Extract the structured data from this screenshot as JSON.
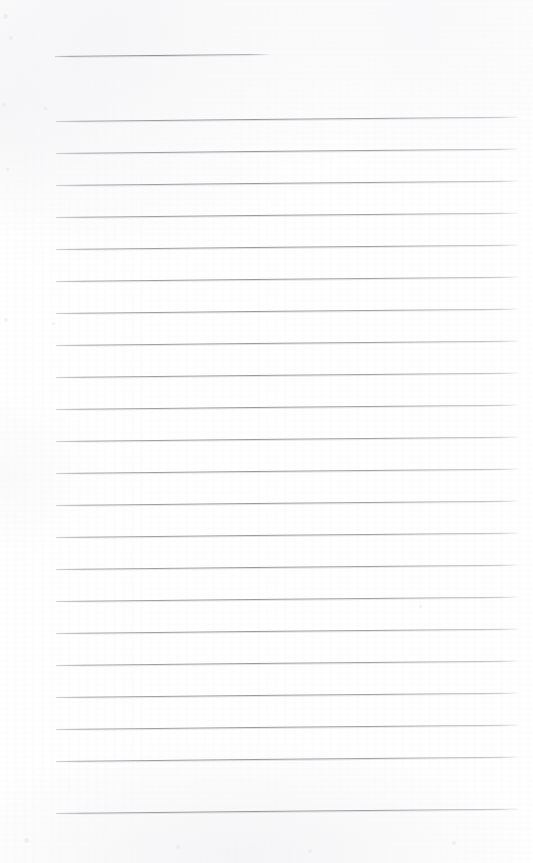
{
  "document": {
    "kind": "scanned-blank-ruled-notepad-page",
    "page_width": 533,
    "page_height": 863,
    "background_color": "#ffffff",
    "paper_tone_color": "#fdfdfe",
    "rule_color": "#96969d",
    "rule_thickness_px": 1,
    "rule_tilt_degrees": -0.55,
    "written_text": "",
    "page_number_text": "",
    "header_text": "",
    "footer_text": ""
  },
  "ruling": {
    "line_spacing_px": 32,
    "left_margin_px": 56,
    "right_margin_px": 518,
    "body_line_count": 22,
    "header_rule": {
      "label": "header-rule",
      "x": 55,
      "y": 56,
      "width": 215
    },
    "lines": [
      {
        "index": 1,
        "y": 121,
        "x": 56,
        "width": 462
      },
      {
        "index": 2,
        "y": 153,
        "x": 56,
        "width": 462
      },
      {
        "index": 3,
        "y": 185,
        "x": 56,
        "width": 462
      },
      {
        "index": 4,
        "y": 217,
        "x": 56,
        "width": 462
      },
      {
        "index": 5,
        "y": 249,
        "x": 56,
        "width": 462
      },
      {
        "index": 6,
        "y": 281,
        "x": 56,
        "width": 462
      },
      {
        "index": 7,
        "y": 313,
        "x": 56,
        "width": 462
      },
      {
        "index": 8,
        "y": 345,
        "x": 56,
        "width": 462
      },
      {
        "index": 9,
        "y": 377,
        "x": 56,
        "width": 462
      },
      {
        "index": 10,
        "y": 409,
        "x": 56,
        "width": 462
      },
      {
        "index": 11,
        "y": 441,
        "x": 56,
        "width": 462
      },
      {
        "index": 12,
        "y": 473,
        "x": 56,
        "width": 462
      },
      {
        "index": 13,
        "y": 505,
        "x": 56,
        "width": 462
      },
      {
        "index": 14,
        "y": 537,
        "x": 56,
        "width": 462
      },
      {
        "index": 15,
        "y": 569,
        "x": 56,
        "width": 462
      },
      {
        "index": 16,
        "y": 601,
        "x": 56,
        "width": 462
      },
      {
        "index": 17,
        "y": 633,
        "x": 56,
        "width": 462
      },
      {
        "index": 18,
        "y": 665,
        "x": 56,
        "width": 462
      },
      {
        "index": 19,
        "y": 697,
        "x": 56,
        "width": 462
      },
      {
        "index": 20,
        "y": 729,
        "x": 56,
        "width": 462
      },
      {
        "index": 21,
        "y": 761,
        "x": 56,
        "width": 462
      },
      {
        "index": 22,
        "y": 813,
        "x": 56,
        "width": 462
      }
    ]
  },
  "specks": [
    {
      "x": 3,
      "y": 14,
      "size": 5
    },
    {
      "x": 9,
      "y": 36,
      "size": 4
    },
    {
      "x": 2,
      "y": 103,
      "size": 4
    },
    {
      "x": 44,
      "y": 107,
      "size": 3
    },
    {
      "x": 6,
      "y": 168,
      "size": 3
    },
    {
      "x": 4,
      "y": 318,
      "size": 4
    },
    {
      "x": 52,
      "y": 322,
      "size": 3
    },
    {
      "x": 419,
      "y": 605,
      "size": 3
    },
    {
      "x": 24,
      "y": 838,
      "size": 5
    },
    {
      "x": 176,
      "y": 845,
      "size": 4
    },
    {
      "x": 308,
      "y": 849,
      "size": 4
    },
    {
      "x": 452,
      "y": 841,
      "size": 4
    }
  ]
}
